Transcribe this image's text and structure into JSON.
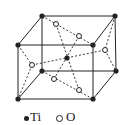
{
  "diagram": {
    "type": "crystal-unit-cell",
    "structure": "rutile TiO2",
    "colors": {
      "line": "#222222",
      "background": "#ffffff"
    },
    "legend": [
      {
        "symbol": "filled-circle",
        "label": "Ti"
      },
      {
        "symbol": "open-circle",
        "label": "O"
      }
    ]
  }
}
